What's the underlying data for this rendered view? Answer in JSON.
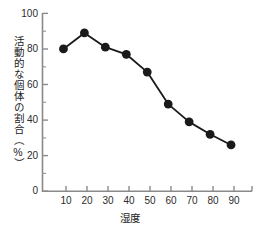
{
  "chart_data": {
    "type": "line",
    "title": "",
    "xlabel": "湿度",
    "ylabel": "活動的な個体の割合（%）",
    "x": [
      10,
      20,
      30,
      40,
      50,
      60,
      70,
      80,
      90
    ],
    "values": [
      80,
      89,
      81,
      77,
      67,
      49,
      39,
      32,
      26
    ],
    "series": [
      {
        "name": "活動的な個体の割合",
        "values": [
          80,
          89,
          81,
          77,
          67,
          49,
          39,
          32,
          26
        ]
      }
    ],
    "xlim": [
      0,
      100
    ],
    "ylim": [
      0,
      100
    ],
    "xticks": [
      "10",
      "20",
      "30",
      "40",
      "50",
      "60",
      "70",
      "80",
      "90"
    ],
    "yticks": [
      "0",
      "20",
      "40",
      "60",
      "80",
      "100"
    ],
    "y_minor_ticks": [
      10,
      30,
      50,
      70,
      90
    ],
    "grid": false,
    "legend": "none",
    "marker": "circle",
    "marker_color": "#1a1a1a",
    "line_color": "#1a1a1a",
    "axis_color": "#8a8a8a"
  },
  "axes": {
    "y_title": "活動的な個体の割合（%）",
    "x_title": "湿度"
  },
  "ytick_labels": [
    "100",
    "80",
    "60",
    "40",
    "20",
    "0"
  ],
  "xtick_labels": [
    "10",
    "20",
    "30",
    "40",
    "50",
    "60",
    "70",
    "80",
    "90"
  ]
}
